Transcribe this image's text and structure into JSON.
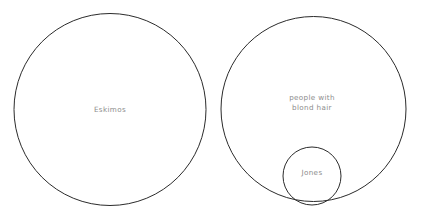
{
  "diagram": {
    "type": "euler-diagram",
    "background_color": "#ffffff",
    "stroke_color": "#2b2b2b",
    "label_color": "#8c8c8c",
    "sets": [
      {
        "id": "eskimos",
        "label": "Eskimos",
        "shape": "circle",
        "cx": 110,
        "cy": 109.5,
        "r": 96,
        "contains": []
      },
      {
        "id": "blond-hair",
        "label": "people with\nblond hair",
        "shape": "circle",
        "cx": 313.5,
        "cy": 109,
        "r": 92.5,
        "contains": [
          "jones"
        ]
      },
      {
        "id": "jones",
        "label": "Jones",
        "shape": "circle",
        "cx": 312,
        "cy": 176,
        "r": 29,
        "contains": []
      }
    ]
  }
}
